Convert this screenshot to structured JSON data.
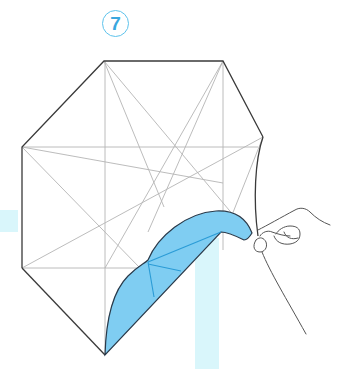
{
  "diagram": {
    "type": "origami-instruction",
    "step_number": "7",
    "colors": {
      "step_badge": "#3aa7de",
      "step_badge_border": "#5ec3ec",
      "paper_outline": "#3a3a3a",
      "crease_lines": "#b4b4b4",
      "flap_fill": "#7fcdf2",
      "flap_crease": "#2a9bd6",
      "guide_bars": "#d9f6fb",
      "hand_line": "#555555"
    },
    "elements": {
      "paper": "octagonal paper with crease pattern",
      "flap": "blue colored flap being lifted",
      "hand": "hand pinching and pulling corner"
    }
  }
}
